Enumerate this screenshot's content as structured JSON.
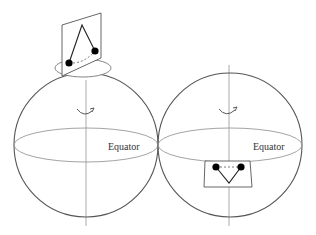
{
  "figure": {
    "colors": {
      "outline": "#555555",
      "axis": "#aaaaaa",
      "equator": "#999999",
      "pendulum": "#222222",
      "bob": "#000000",
      "background": "#ffffff"
    }
  },
  "left_sphere": {
    "equator_label": "Equator",
    "rotation_arrow": "counterclockwise-rotation-arrow",
    "pendulum_location": "north-pole"
  },
  "right_sphere": {
    "equator_label": "Equator",
    "rotation_arrow": "counterclockwise-rotation-arrow",
    "pendulum_location": "equator"
  }
}
